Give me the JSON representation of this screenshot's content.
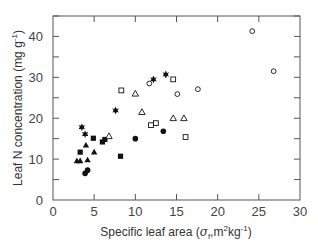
{
  "chart_data": {
    "type": "scatter",
    "title": "",
    "xlabel": "Specific leaf area (σf, m²kg⁻¹)",
    "ylabel": "Leaf N concentration (mg g⁻¹)",
    "xlim": [
      0,
      30
    ],
    "ylim": [
      0,
      45
    ],
    "xticks": [
      0,
      5,
      10,
      15,
      20,
      25,
      30
    ],
    "yticks": [
      0,
      10,
      20,
      30,
      40
    ],
    "grid": false,
    "legend": null,
    "series": [
      {
        "name": "filled-circle",
        "marker": "filled-circle",
        "points": [
          [
            3.9,
            6.5
          ],
          [
            4.2,
            7.3
          ],
          [
            10.0,
            15.0
          ],
          [
            13.4,
            16.8
          ]
        ]
      },
      {
        "name": "filled-square",
        "marker": "filled-square",
        "points": [
          [
            3.3,
            11.7
          ],
          [
            4.9,
            15.1
          ],
          [
            6.0,
            14.2
          ],
          [
            6.3,
            14.8
          ],
          [
            8.2,
            10.7
          ]
        ]
      },
      {
        "name": "filled-triangle",
        "marker": "filled-triangle",
        "points": [
          [
            2.9,
            9.6
          ],
          [
            3.3,
            9.6
          ],
          [
            4.2,
            9.8
          ],
          [
            4.0,
            13.4
          ],
          [
            5.0,
            11.7
          ]
        ]
      },
      {
        "name": "asterisk",
        "marker": "asterisk",
        "points": [
          [
            3.5,
            17.8
          ],
          [
            3.9,
            16.1
          ],
          [
            7.6,
            21.9
          ],
          [
            12.2,
            29.5
          ],
          [
            13.7,
            30.7
          ]
        ]
      },
      {
        "name": "open-circle",
        "marker": "open-circle",
        "points": [
          [
            11.7,
            28.5
          ],
          [
            15.1,
            25.9
          ],
          [
            17.6,
            27.1
          ],
          [
            24.2,
            41.3
          ],
          [
            26.8,
            31.5
          ]
        ]
      },
      {
        "name": "open-square",
        "marker": "open-square",
        "points": [
          [
            8.3,
            26.8
          ],
          [
            11.9,
            18.3
          ],
          [
            12.5,
            18.8
          ],
          [
            14.6,
            29.5
          ],
          [
            16.1,
            15.4
          ]
        ]
      },
      {
        "name": "open-triangle",
        "marker": "open-triangle",
        "points": [
          [
            6.8,
            15.6
          ],
          [
            10.0,
            26.0
          ],
          [
            10.8,
            21.5
          ],
          [
            14.6,
            20.0
          ],
          [
            15.9,
            20.0
          ]
        ]
      }
    ]
  },
  "axes": {
    "x_title_main": "Specific leaf area (",
    "x_title_sigma": "σ",
    "x_title_sub": "f",
    "x_title_rest": ",m",
    "x_title_sup1": "2",
    "x_title_kg": "kg",
    "x_title_sup2": "-1",
    "x_title_close": ")",
    "y_title_main": "Leaf N concentration (mg g",
    "y_title_sup": "-1",
    "y_title_close": ")"
  },
  "colors": {
    "axis": "#555555",
    "marker": "#111111",
    "background": "#ffffff"
  }
}
